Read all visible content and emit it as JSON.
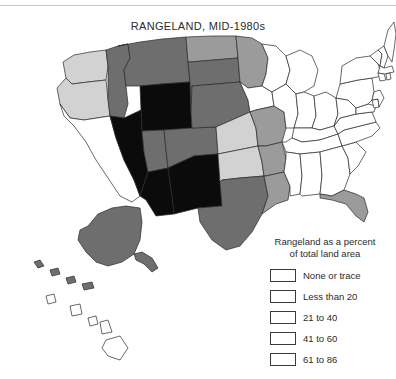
{
  "title": "RANGELAND, MID-1980s",
  "legend": {
    "heading_line1": "Rangeland as a percent",
    "heading_line2": "of total land area",
    "entries": [
      {
        "label": "None or trace",
        "color": "#ffffff",
        "class": "c0"
      },
      {
        "label": "Less than 20",
        "color": "#9b9b9b",
        "class": "c1"
      },
      {
        "label": "21 to 40",
        "color": "#d2d2d2",
        "class": "c2"
      },
      {
        "label": "41 to 60",
        "color": "#6e6e6e",
        "class": "c3"
      },
      {
        "label": "61 to 86",
        "color": "#0b0b0b",
        "class": "c4"
      }
    ]
  },
  "map": {
    "description": "Choropleth map of the United States showing rangeland as a percent of total land area, mid-1980s",
    "states": [
      {
        "name": "Washington",
        "category": "21 to 40"
      },
      {
        "name": "Oregon",
        "category": "21 to 40"
      },
      {
        "name": "California",
        "category": "None or trace"
      },
      {
        "name": "Nevada",
        "category": "61 to 86"
      },
      {
        "name": "Idaho",
        "category": "41 to 60"
      },
      {
        "name": "Montana",
        "category": "41 to 60"
      },
      {
        "name": "Wyoming",
        "category": "61 to 86"
      },
      {
        "name": "Utah",
        "category": "41 to 60"
      },
      {
        "name": "Arizona",
        "category": "61 to 86"
      },
      {
        "name": "New Mexico",
        "category": "61 to 86"
      },
      {
        "name": "Colorado",
        "category": "41 to 60"
      },
      {
        "name": "North Dakota",
        "category": "Less than 20"
      },
      {
        "name": "South Dakota",
        "category": "41 to 60"
      },
      {
        "name": "Nebraska",
        "category": "41 to 60"
      },
      {
        "name": "Kansas",
        "category": "21 to 40"
      },
      {
        "name": "Oklahoma",
        "category": "21 to 40"
      },
      {
        "name": "Texas",
        "category": "41 to 60"
      },
      {
        "name": "Minnesota",
        "category": "Less than 20"
      },
      {
        "name": "Iowa",
        "category": "None or trace"
      },
      {
        "name": "Missouri",
        "category": "Less than 20"
      },
      {
        "name": "Arkansas",
        "category": "Less than 20"
      },
      {
        "name": "Louisiana",
        "category": "Less than 20"
      },
      {
        "name": "Wisconsin",
        "category": "None or trace"
      },
      {
        "name": "Illinois",
        "category": "None or trace"
      },
      {
        "name": "Michigan",
        "category": "None or trace"
      },
      {
        "name": "Indiana",
        "category": "None or trace"
      },
      {
        "name": "Ohio",
        "category": "None or trace"
      },
      {
        "name": "Kentucky",
        "category": "None or trace"
      },
      {
        "name": "Tennessee",
        "category": "None or trace"
      },
      {
        "name": "Mississippi",
        "category": "None or trace"
      },
      {
        "name": "Alabama",
        "category": "None or trace"
      },
      {
        "name": "Georgia",
        "category": "None or trace"
      },
      {
        "name": "Florida",
        "category": "Less than 20"
      },
      {
        "name": "South Carolina",
        "category": "None or trace"
      },
      {
        "name": "North Carolina",
        "category": "None or trace"
      },
      {
        "name": "Virginia",
        "category": "None or trace"
      },
      {
        "name": "West Virginia",
        "category": "None or trace"
      },
      {
        "name": "Pennsylvania",
        "category": "None or trace"
      },
      {
        "name": "New York",
        "category": "None or trace"
      },
      {
        "name": "Maine",
        "category": "None or trace"
      },
      {
        "name": "Vermont",
        "category": "None or trace"
      },
      {
        "name": "New Hampshire",
        "category": "None or trace"
      },
      {
        "name": "Massachusetts",
        "category": "None or trace"
      },
      {
        "name": "Connecticut",
        "category": "None or trace"
      },
      {
        "name": "Rhode Island",
        "category": "None or trace"
      },
      {
        "name": "New Jersey",
        "category": "None or trace"
      },
      {
        "name": "Delaware",
        "category": "None or trace"
      },
      {
        "name": "Maryland",
        "category": "None or trace"
      },
      {
        "name": "Alaska",
        "category": "41 to 60"
      },
      {
        "name": "Hawaii",
        "category": "None or trace"
      }
    ]
  }
}
